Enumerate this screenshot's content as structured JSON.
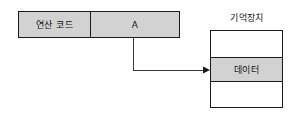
{
  "diagram": {
    "instruction": {
      "opcode_label": "연산 코드",
      "operand_label": "A"
    },
    "memory": {
      "title": "기억장치",
      "rows": [
        {
          "label": "",
          "shaded": false
        },
        {
          "label": "데이터",
          "shaded": true
        },
        {
          "label": "",
          "shaded": false
        }
      ]
    },
    "connector": {
      "name": "operand-to-data-arrow"
    },
    "colors": {
      "fill_gray": "#d2d2d2",
      "stroke": "#1a1a1a",
      "background": "#ffffff",
      "text": "#111111"
    }
  }
}
